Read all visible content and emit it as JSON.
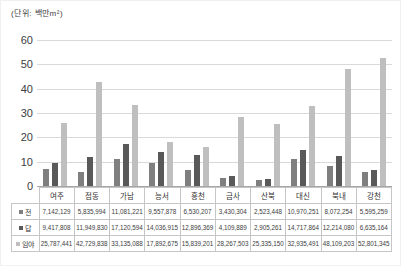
{
  "chart_data": {
    "type": "bar",
    "title": "",
    "unit_label": "(단위: 백만m²)",
    "categories": [
      "여주",
      "점동",
      "가남",
      "능서",
      "흥천",
      "금사",
      "산북",
      "대신",
      "북내",
      "강천"
    ],
    "series": [
      {
        "name": "전",
        "color": "#7f7f7f",
        "cell_values": [
          "7,142,129",
          "5,835,994",
          "11,081,221",
          "9,557,878",
          "6,530,207",
          "3,430,304",
          "2,523,448",
          "10,970,251",
          "8,072,254",
          "5,595,259"
        ]
      },
      {
        "name": "답",
        "color": "#595959",
        "cell_values": [
          "9,417,808",
          "11,949,830",
          "17,120,594",
          "14,036,915",
          "12,896,369",
          "4,109,889",
          "2,905,261",
          "14,717,864",
          "12,214,080",
          "6,635,164"
        ]
      },
      {
        "name": "임야",
        "color": "#bfbfbf",
        "cell_values": [
          "25,787,441",
          "42,729,838",
          "33,135,088",
          "17,892,675",
          "15,839,201",
          "28,267,503",
          "25,335,150",
          "32,935,491",
          "48,109,203",
          "52,801,345"
        ]
      }
    ],
    "bar_unit_divisor": 1000000,
    "xlabel": "",
    "ylabel": "",
    "ylim": [
      0,
      60
    ],
    "y_ticks": [
      "60",
      "50",
      "40",
      "30",
      "20",
      "10",
      "0"
    ],
    "y_step": 10,
    "grid": true,
    "legend_position": "table-row-headers"
  }
}
